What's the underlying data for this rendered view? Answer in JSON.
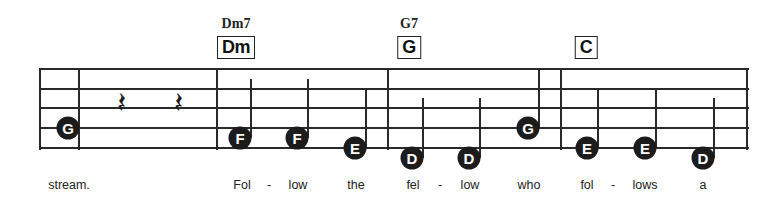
{
  "chords": [
    {
      "name": "Dm7",
      "box": "Dm",
      "x": 236
    },
    {
      "name": "G7",
      "box": "G",
      "x": 409
    },
    {
      "name": "",
      "box": "C",
      "x": 586
    }
  ],
  "staff": {
    "left": 40,
    "right": 748,
    "lines_y": [
      69,
      89,
      108,
      128,
      148
    ],
    "bar_lines_x": [
      40,
      79,
      217,
      388,
      561,
      747
    ]
  },
  "rests": [
    {
      "symbol": "𝄽",
      "x": 121
    },
    {
      "symbol": "𝄽",
      "x": 178
    }
  ],
  "notes": [
    {
      "label": "G",
      "x": 68,
      "y": 128,
      "stem": false
    },
    {
      "label": "F",
      "x": 240,
      "y": 138,
      "stem": true,
      "stem_top": 79
    },
    {
      "label": "F",
      "x": 297,
      "y": 138,
      "stem": true,
      "stem_top": 79
    },
    {
      "label": "E",
      "x": 355,
      "y": 148,
      "stem": true,
      "stem_top": 89
    },
    {
      "label": "D",
      "x": 412,
      "y": 158,
      "stem": true,
      "stem_top": 98
    },
    {
      "label": "D",
      "x": 469,
      "y": 158,
      "stem": true,
      "stem_top": 98
    },
    {
      "label": "G",
      "x": 528,
      "y": 128,
      "stem": true,
      "stem_top": 69
    },
    {
      "label": "E",
      "x": 587,
      "y": 148,
      "stem": true,
      "stem_top": 89
    },
    {
      "label": "E",
      "x": 645,
      "y": 148,
      "stem": true,
      "stem_top": 89
    },
    {
      "label": "D",
      "x": 703,
      "y": 158,
      "stem": true,
      "stem_top": 98
    }
  ],
  "lyrics": [
    {
      "text": "stream.",
      "x": 69
    },
    {
      "text": "Fol",
      "x": 242
    },
    {
      "text": "-",
      "x": 269
    },
    {
      "text": "low",
      "x": 298
    },
    {
      "text": "the",
      "x": 356
    },
    {
      "text": "fel",
      "x": 413
    },
    {
      "text": "-",
      "x": 440
    },
    {
      "text": "low",
      "x": 470
    },
    {
      "text": "who",
      "x": 529
    },
    {
      "text": "fol",
      "x": 587
    },
    {
      "text": "-",
      "x": 613
    },
    {
      "text": "lows",
      "x": 645
    },
    {
      "text": "a",
      "x": 703
    }
  ]
}
